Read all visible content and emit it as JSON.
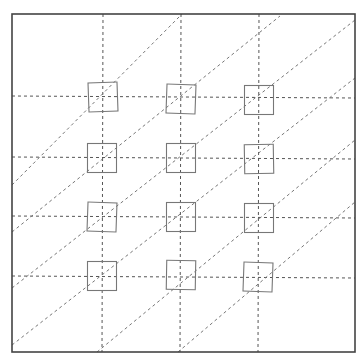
{
  "diagram": {
    "type": "grid-with-diagonals",
    "colors": {
      "frame": "#444444",
      "grid": "#555555",
      "diagonals": "#777777",
      "squares": "#777777",
      "background": "#ffffff"
    },
    "frame": {
      "x1": 12,
      "y1": 14,
      "x2": 355,
      "y2": 352
    },
    "horizontal_lines_y": [
      96,
      157,
      216,
      276
    ],
    "vertical_lines_x": [
      103,
      181,
      259
    ],
    "square_size": 29,
    "squares": [
      {
        "cx": 103,
        "cy": 97,
        "rot": -2
      },
      {
        "cx": 181,
        "cy": 99,
        "rot": 2
      },
      {
        "cx": 259,
        "cy": 100,
        "rot": 0
      },
      {
        "cx": 102,
        "cy": 158,
        "rot": 0
      },
      {
        "cx": 181,
        "cy": 158,
        "rot": 0
      },
      {
        "cx": 259,
        "cy": 159,
        "rot": -1
      },
      {
        "cx": 102,
        "cy": 217,
        "rot": 2
      },
      {
        "cx": 181,
        "cy": 217,
        "rot": 0
      },
      {
        "cx": 259,
        "cy": 218,
        "rot": 0
      },
      {
        "cx": 102,
        "cy": 276,
        "rot": 0
      },
      {
        "cx": 181,
        "cy": 275,
        "rot": 1
      },
      {
        "cx": 258,
        "cy": 277,
        "rot": 2
      }
    ],
    "diagonal_lines": [
      {
        "x1": 12,
        "y1": 185,
        "x2": 182,
        "y2": 14
      },
      {
        "x1": 12,
        "y1": 232,
        "x2": 280,
        "y2": 16
      },
      {
        "x1": 12,
        "y1": 288,
        "x2": 355,
        "y2": 20
      },
      {
        "x1": 12,
        "y1": 345,
        "x2": 355,
        "y2": 78
      },
      {
        "x1": 97,
        "y1": 352,
        "x2": 355,
        "y2": 140
      },
      {
        "x1": 178,
        "y1": 352,
        "x2": 355,
        "y2": 202
      }
    ]
  }
}
